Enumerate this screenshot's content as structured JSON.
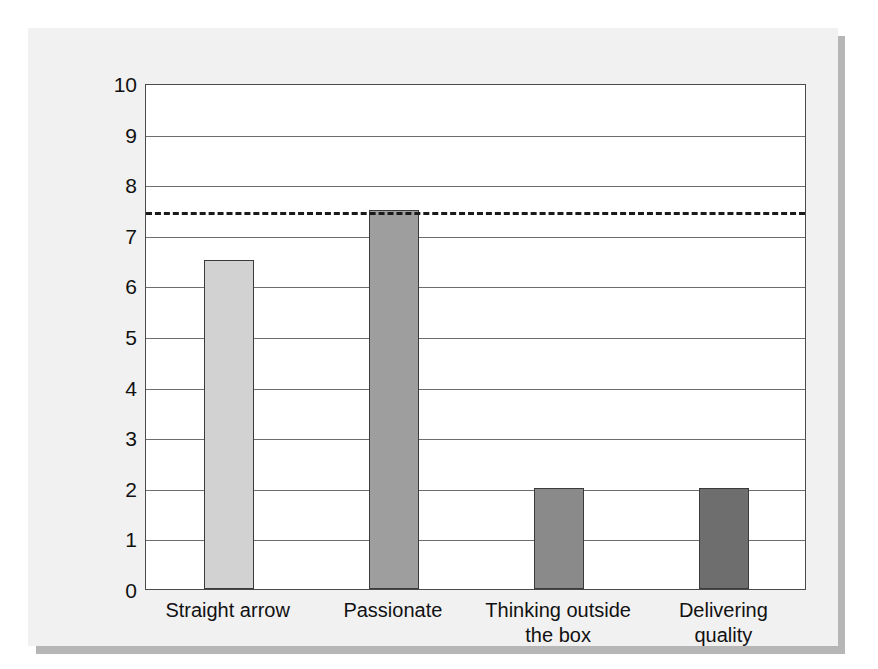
{
  "chart_data": {
    "type": "bar",
    "title": "",
    "subtitle": "",
    "xlabel": "",
    "ylabel": "",
    "categories": [
      "Straight arrow",
      "Passionate",
      "Thinking outside the box",
      "Delivering quality"
    ],
    "values": [
      6.5,
      7.5,
      2.0,
      2.0
    ],
    "series": [
      {
        "name": "",
        "values": [
          6.5,
          7.5,
          2.0,
          2.0
        ]
      }
    ],
    "ylim": [
      0,
      10
    ],
    "ytick_labels": [
      "10",
      "9",
      "8",
      "7",
      "6",
      "5",
      "4",
      "3",
      "2",
      "1",
      "0"
    ],
    "ytick_values": [
      10,
      9,
      8,
      7,
      6,
      5,
      4,
      3,
      2,
      1,
      0
    ],
    "grid": true,
    "grid_axis": "y",
    "legend": false,
    "legend_position": "none",
    "annotations": [
      {
        "name": "threshold-line",
        "type": "horizontal-dashed-reference-line",
        "value": 7.5,
        "label": "",
        "color": "#1a1a1a"
      }
    ],
    "bar_colors": [
      "#d2d2d2",
      "#9e9e9e",
      "#8a8a8a",
      "#6e6e6e"
    ],
    "bar_edge_color": "#3b3b3b"
  },
  "figure": {
    "panel_background": "#f1f1f1",
    "plot_background": "#ffffff",
    "shadow_color": "#b6b6b6",
    "axis_color": "#4a4a4a",
    "gridline_color": "#6d6d6d",
    "text_color": "#111111"
  }
}
